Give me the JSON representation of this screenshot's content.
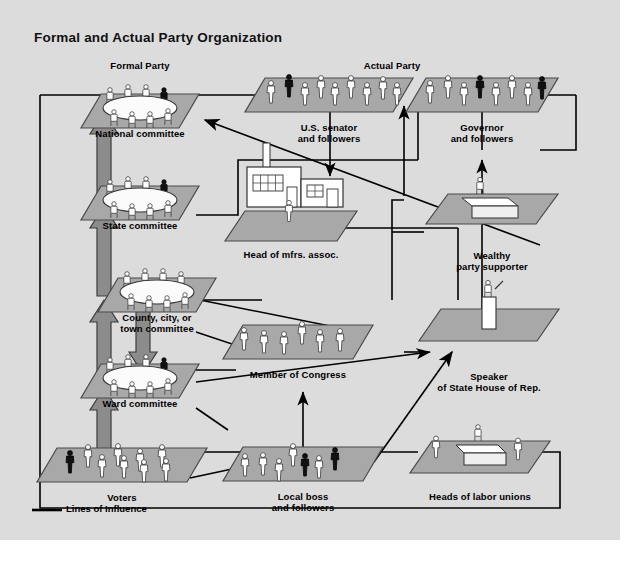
{
  "title": "Formal and Actual Party Organization",
  "columns": {
    "formal_header": "Formal Party",
    "actual_header": "Actual Party"
  },
  "legend": {
    "label": "Lines of Influence",
    "line_color": "#000000"
  },
  "colors": {
    "panel_bg": "#dcdcdc",
    "platform_fill": "#a8a8a8",
    "platform_stroke": "#4a4a4a",
    "thick_arrow_fill": "#8c8c8c",
    "thick_arrow_stroke": "#3c3c3c",
    "line": "#000000",
    "figure_light": "#ffffff",
    "figure_dark": "#000000",
    "text": "#000000"
  },
  "nodes": [
    {
      "id": "national",
      "label": "National committee",
      "x": 140,
      "y": 128,
      "kind": "committee-table"
    },
    {
      "id": "state",
      "label": "State committee",
      "x": 140,
      "y": 220,
      "kind": "committee-table"
    },
    {
      "id": "county",
      "label": "County, city, or\ntown committee",
      "x": 157,
      "y": 312,
      "kind": "committee-table"
    },
    {
      "id": "ward",
      "label": "Ward committee",
      "x": 140,
      "y": 398,
      "kind": "committee-table"
    },
    {
      "id": "voters",
      "label": "Voters",
      "x": 122,
      "y": 492,
      "kind": "crowd"
    },
    {
      "id": "senator",
      "label": "U.S. senator\nand followers",
      "x": 329,
      "y": 122,
      "kind": "crowd"
    },
    {
      "id": "mfrs",
      "label": "Head of mfrs. assoc.",
      "x": 291,
      "y": 249,
      "kind": "factory"
    },
    {
      "id": "congress",
      "label": "Member of Congress",
      "x": 298,
      "y": 369,
      "kind": "crowd"
    },
    {
      "id": "localboss",
      "label": "Local boss\nand followers",
      "x": 303,
      "y": 491,
      "kind": "crowd"
    },
    {
      "id": "governor",
      "label": "Governor\nand followers",
      "x": 482,
      "y": 122,
      "kind": "crowd"
    },
    {
      "id": "wealthy",
      "label": "Wealthy\nparty supporter",
      "x": 492,
      "y": 250,
      "kind": "desk"
    },
    {
      "id": "speaker",
      "label": "Speaker\nof State House of Rep.",
      "x": 489,
      "y": 371,
      "kind": "podium"
    },
    {
      "id": "labor",
      "label": "Heads of labor unions",
      "x": 480,
      "y": 491,
      "kind": "desk-pair"
    }
  ],
  "chart_data": {
    "type": "diagram",
    "title": "Formal and Actual Party Organization",
    "groups": [
      {
        "name": "Formal Party",
        "members": [
          "National committee",
          "State committee",
          "County, city, or town committee",
          "Ward committee",
          "Voters"
        ]
      },
      {
        "name": "Actual Party",
        "members": [
          "U.S. senator and followers",
          "Head of mfrs. assoc.",
          "Member of Congress",
          "Local boss and followers",
          "Governor and followers",
          "Wealthy party supporter",
          "Speaker of State House of Rep.",
          "Heads of labor unions"
        ]
      }
    ],
    "edge_legend": "Lines of Influence"
  }
}
